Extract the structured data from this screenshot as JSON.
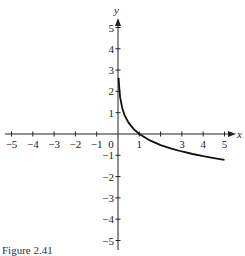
{
  "chart_data": {
    "type": "line",
    "title": "",
    "xlabel": "x",
    "ylabel": "y",
    "xlim": [
      -5,
      5
    ],
    "ylim": [
      -5,
      5
    ],
    "grid": false,
    "x_ticks": [
      -5,
      -4,
      -3,
      -2,
      -1,
      0,
      1,
      2,
      3,
      4,
      5
    ],
    "x_tick_labels": [
      "-5",
      "-4",
      "-3",
      "-2",
      "-1",
      "0",
      "1",
      "",
      "3",
      "4",
      "5"
    ],
    "y_ticks": [
      -5,
      -4,
      -3,
      -2,
      -1,
      1,
      2,
      3,
      4,
      5
    ],
    "y_tick_labels": [
      "-5",
      "-4",
      "-3",
      "-2",
      "-1",
      "1",
      "2",
      "3",
      "4",
      "5"
    ],
    "series": [
      {
        "name": "f(x)",
        "description": "decreasing logarithmic curve, vertical asymptote x=0, crosses x-axis at (1,0)",
        "x": [
          0.03,
          0.05,
          0.1,
          0.2,
          0.3,
          0.5,
          0.75,
          1,
          1.5,
          2,
          2.5,
          3,
          3.5,
          4,
          4.5,
          5
        ],
        "y": [
          2.63,
          2.25,
          1.73,
          1.21,
          0.9,
          0.52,
          0.22,
          0,
          -0.3,
          -0.52,
          -0.69,
          -0.82,
          -0.94,
          -1.04,
          -1.13,
          -1.21
        ]
      }
    ],
    "legend": null
  },
  "caption": "Figure 2.41"
}
